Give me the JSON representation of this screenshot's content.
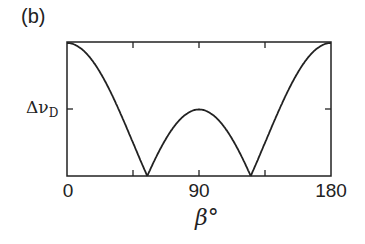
{
  "panel_label": "(b)",
  "chart_data": {
    "type": "line",
    "title": "",
    "panel": "(b)",
    "xlabel": "β°",
    "ylabel": "",
    "xlim": [
      0,
      180
    ],
    "x_ticks": [
      0,
      90,
      180
    ],
    "x_minor_ticks": [
      45,
      135
    ],
    "y_tick_labels": [
      "Δν_D"
    ],
    "y_tick_symbol": "Δν",
    "y_tick_subscript": "D",
    "y_tick_position_relative": 0.5,
    "grid": false,
    "legend": null,
    "series": [
      {
        "name": "splitting",
        "x": [
          0,
          10,
          20,
          30,
          40,
          50,
          54.7,
          60,
          70,
          80,
          90,
          100,
          110,
          120,
          125.3,
          130,
          140,
          150,
          160,
          170,
          180
        ],
        "y": [
          1.0,
          0.955,
          0.825,
          0.625,
          0.38,
          0.12,
          0.0,
          0.125,
          0.325,
          0.455,
          0.5,
          0.455,
          0.325,
          0.125,
          0.0,
          0.12,
          0.38,
          0.625,
          0.825,
          0.955,
          1.0
        ]
      }
    ]
  },
  "x_tick_labels": {
    "t0": "0",
    "t90": "90",
    "t180": "180"
  },
  "y_tick": {
    "main": "Δν",
    "sub": "D"
  },
  "x_axis_label": "β°"
}
